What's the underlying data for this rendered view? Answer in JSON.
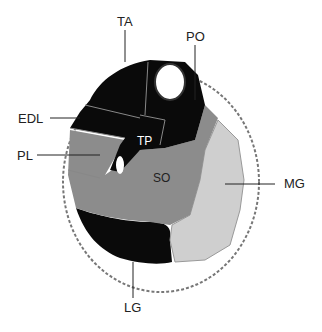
{
  "diagram": {
    "type": "leg cross-section",
    "labels": {
      "TA": "TA",
      "PO": "PO",
      "EDL": "EDL",
      "PL": "PL",
      "TP": "TP",
      "SO": "SO",
      "MG": "MG",
      "LG": "LG"
    },
    "colors": {
      "dark": "#0a0a0a",
      "mid": "#8c8c8c",
      "light": "#cfcfcf",
      "outline": "#666666"
    }
  }
}
